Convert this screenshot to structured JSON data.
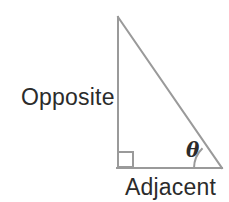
{
  "diagram": {
    "type": "right-triangle-trigonometry",
    "background_color": "#ffffff",
    "stroke_color": "#9a9a9a",
    "text_color": "#2b2b2b",
    "labels": {
      "opposite": "Opposite",
      "adjacent": "Adjacent",
      "angle": "θ"
    },
    "geometry": {
      "apex": {
        "x": 118,
        "y": 17
      },
      "right_angle_vertex": {
        "x": 118,
        "y": 168
      },
      "theta_vertex": {
        "x": 222,
        "y": 168
      },
      "vertical_leg_label": "Opposite",
      "horizontal_leg_label": "Adjacent",
      "right_angle_marker_size": 15,
      "angle_arc_radius": 28
    }
  }
}
